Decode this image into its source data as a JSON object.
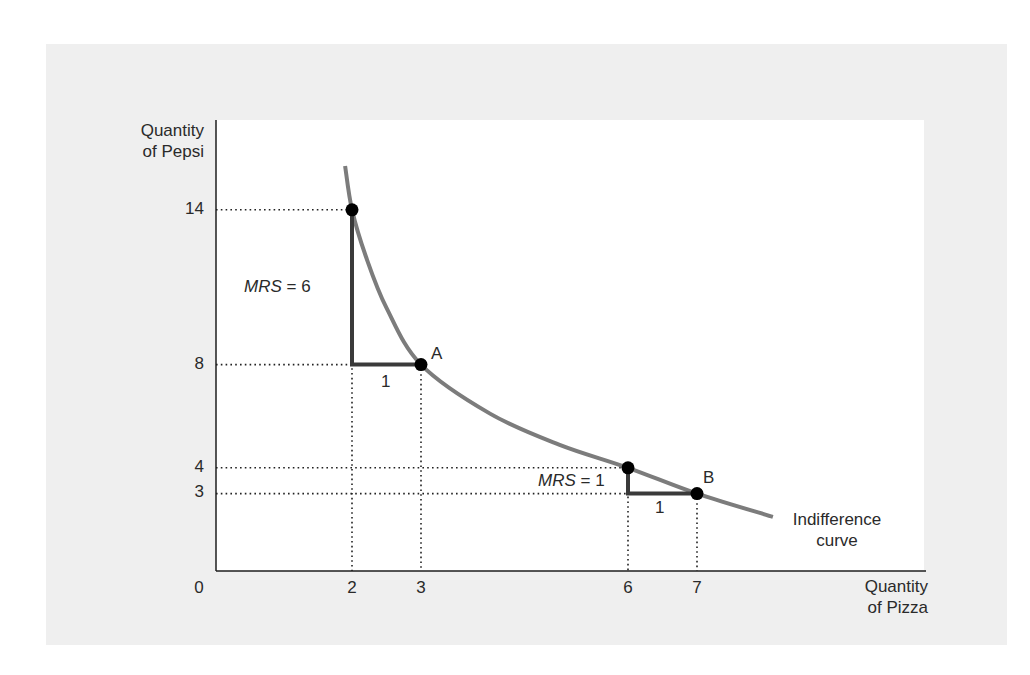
{
  "chart_data": {
    "type": "line",
    "title": "",
    "xlabel": "Quantity of Pizza",
    "ylabel": "Quantity of Pepsi",
    "xlabel_lines": [
      "Quantity",
      "of Pizza"
    ],
    "ylabel_lines": [
      "Quantity",
      "of Pepsi"
    ],
    "origin_label": "0",
    "x_ticks": [
      2,
      3,
      6,
      7
    ],
    "y_ticks": [
      3,
      4,
      8,
      14
    ],
    "xlim": [
      0,
      10
    ],
    "ylim": [
      0,
      17.5
    ],
    "grid": false,
    "series": [
      {
        "name": "Indifference curve",
        "label_lines": [
          "Indifference",
          "curve"
        ],
        "points": [
          [
            1.9,
            15.7
          ],
          [
            2,
            14
          ],
          [
            2.2,
            12.2
          ],
          [
            2.5,
            10.2
          ],
          [
            3,
            8
          ],
          [
            4,
            6.1
          ],
          [
            5,
            4.9
          ],
          [
            6,
            4
          ],
          [
            7,
            3
          ],
          [
            8.1,
            2.1
          ]
        ]
      }
    ],
    "marked_points": [
      {
        "x": 2,
        "y": 14,
        "label": ""
      },
      {
        "x": 3,
        "y": 8,
        "label": "A"
      },
      {
        "x": 6,
        "y": 4,
        "label": ""
      },
      {
        "x": 7,
        "y": 3,
        "label": "B"
      }
    ],
    "annotations": [
      {
        "type": "slope-triangle",
        "from": [
          2,
          14
        ],
        "corner": [
          2,
          8
        ],
        "to": [
          3,
          8
        ],
        "rise_label": "MRS = 6",
        "run_label": "1"
      },
      {
        "type": "slope-triangle",
        "from": [
          6,
          4
        ],
        "corner": [
          6,
          3
        ],
        "to": [
          7,
          3
        ],
        "rise_label": "MRS = 1",
        "run_label": "1"
      }
    ],
    "colors": {
      "curve": "#7c7c7c",
      "triangle": "#3a3a3a",
      "points": "#000000",
      "guides": "#222222",
      "panel": "#efefef",
      "plot_bg": "#ffffff"
    }
  },
  "labels": {
    "y_axis_line1": "Quantity",
    "y_axis_line2": "of Pepsi",
    "x_axis_line1": "Quantity",
    "x_axis_line2": "of Pizza",
    "origin": "0",
    "ytick_14": "14",
    "ytick_8": "8",
    "ytick_4": "4",
    "ytick_3": "3",
    "xtick_2": "2",
    "xtick_3": "3",
    "xtick_6": "6",
    "xtick_7": "7",
    "point_a": "A",
    "point_b": "B",
    "mrs6_var": "MRS",
    "mrs6_eq": " = 6",
    "mrs1_var": "MRS",
    "mrs1_eq": " = 1",
    "run1_a": "1",
    "run1_b": "1",
    "curve_line1": "Indifference",
    "curve_line2": "curve"
  }
}
